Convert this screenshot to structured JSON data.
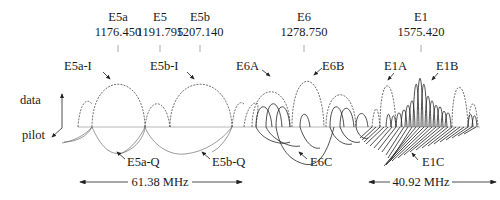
{
  "diagram": {
    "bands": [
      {
        "name": "E5a",
        "freq": "1176.450",
        "x": 118
      },
      {
        "name": "E5",
        "freq": "1191.795",
        "x": 160
      },
      {
        "name": "E5b",
        "freq": "1207.140",
        "x": 200
      },
      {
        "name": "E6",
        "freq": "1278.750",
        "x": 304
      },
      {
        "name": "E1",
        "freq": "1575.420",
        "x": 421
      }
    ],
    "signals": {
      "e5a_i": "E5a-I",
      "e5b_i": "E5b-I",
      "e6a": "E6A",
      "e6b": "E6B",
      "e1a": "E1A",
      "e1b": "E1B",
      "e5a_q": "E5a-Q",
      "e5b_q": "E5b-Q",
      "e6c": "E6C",
      "e1c": "E1C"
    },
    "axes": {
      "data": "data",
      "pilot": "pilot"
    },
    "bandwidths": {
      "e5": "61.38 MHz",
      "e1": "40.92 MHz"
    }
  }
}
